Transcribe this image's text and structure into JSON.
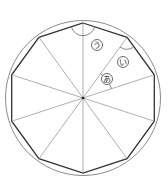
{
  "diagram": {
    "shape": "regular decagon inscribed in circle",
    "sides": 10,
    "center": [
      83,
      98
    ],
    "polygon_radius": 75,
    "circle_radius": 78,
    "labels": {
      "a": "あ",
      "i": "い",
      "u": "う"
    },
    "colors": {
      "polygon": "#333333",
      "circle": "#888888",
      "radii": "#999999"
    }
  }
}
